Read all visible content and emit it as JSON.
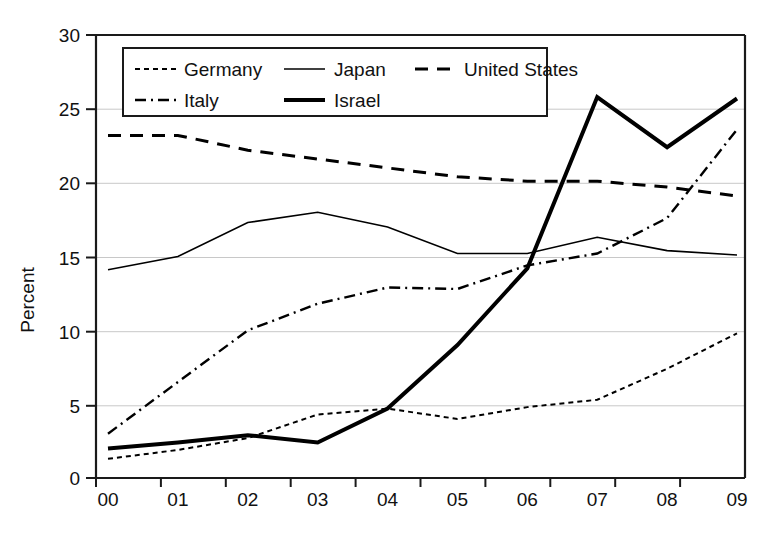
{
  "chart_data": {
    "type": "line",
    "title": "",
    "subtitle": "",
    "xlabel": "",
    "ylabel": "Percent",
    "x": [
      "00",
      "01",
      "02",
      "03",
      "04",
      "05",
      "06",
      "07",
      "08",
      "09"
    ],
    "categories": [
      "00",
      "01",
      "02",
      "03",
      "04",
      "05",
      "06",
      "07",
      "08",
      "09"
    ],
    "xlim": [
      0,
      9
    ],
    "ylim": [
      0,
      30
    ],
    "yticks": [
      0,
      5,
      10,
      15,
      20,
      25,
      30
    ],
    "ytick_labels": [
      "0",
      "5",
      "10",
      "15",
      "20",
      "25",
      "30"
    ],
    "grid": "horizontal",
    "legend_position": "top-left-inside",
    "series": [
      {
        "name": "Germany",
        "style": "dotted",
        "color": "#000000",
        "width": 2,
        "values": [
          1.3,
          1.9,
          2.7,
          4.3,
          4.7,
          4.0,
          4.8,
          5.3,
          7.4,
          9.8
        ]
      },
      {
        "name": "Japan",
        "style": "solid-thin",
        "color": "#000000",
        "width": 1.6,
        "values": [
          14.1,
          15.0,
          17.3,
          18.0,
          17.0,
          15.2,
          15.2,
          16.3,
          15.4,
          15.1
        ]
      },
      {
        "name": "United States",
        "style": "dashed",
        "color": "#000000",
        "width": 3,
        "values": [
          23.2,
          23.2,
          22.2,
          21.6,
          21.0,
          20.4,
          20.1,
          20.1,
          19.7,
          19.1
        ]
      },
      {
        "name": "Italy",
        "style": "dash-dot",
        "color": "#000000",
        "width": 2.4,
        "values": [
          3.0,
          6.5,
          10.0,
          11.8,
          12.9,
          12.8,
          14.4,
          15.2,
          17.6,
          23.6
        ]
      },
      {
        "name": "Israel",
        "style": "solid-thick",
        "color": "#000000",
        "width": 4,
        "values": [
          2.0,
          2.4,
          2.9,
          2.4,
          4.7,
          9.0,
          14.2,
          25.8,
          22.4,
          25.7
        ]
      }
    ],
    "legend": [
      {
        "label": "Germany",
        "style": "dotted"
      },
      {
        "label": "Japan",
        "style": "solid-thin"
      },
      {
        "label": "United States",
        "style": "dashed"
      },
      {
        "label": "Italy",
        "style": "dash-dot"
      },
      {
        "label": "Israel",
        "style": "solid-thick"
      }
    ]
  },
  "axes": {
    "ylabel": "Percent",
    "ytick_labels": [
      "0",
      "5",
      "10",
      "15",
      "20",
      "25",
      "30"
    ],
    "xtick_labels": [
      "00",
      "01",
      "02",
      "03",
      "04",
      "05",
      "06",
      "07",
      "08",
      "09"
    ]
  },
  "legend": {
    "items": [
      {
        "label": "Germany"
      },
      {
        "label": "Japan"
      },
      {
        "label": "United States"
      },
      {
        "label": "Italy"
      },
      {
        "label": "Israel"
      }
    ]
  },
  "caption": {
    "text": ""
  }
}
